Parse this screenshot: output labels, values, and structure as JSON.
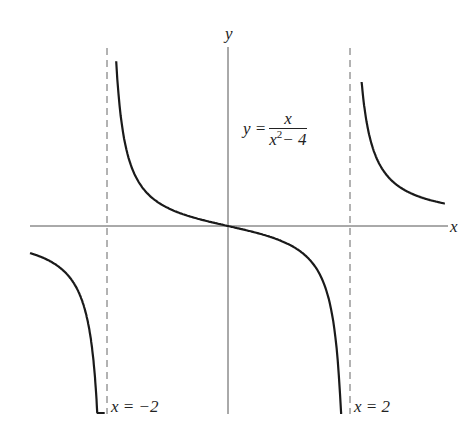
{
  "chart_data": {
    "type": "line",
    "title": "",
    "function": "y = x / (x^2 - 4)",
    "xlabel": "x",
    "ylabel": "y",
    "asymptotes": [
      {
        "type": "vertical",
        "x": -2,
        "label": "x = −2",
        "style": "dashed"
      },
      {
        "type": "vertical",
        "x": 2,
        "label": "x = 2",
        "style": "dashed"
      },
      {
        "type": "horizontal",
        "y": 0,
        "label": "",
        "style": "x-axis"
      }
    ],
    "xlim": [
      -3.26,
      3.6
    ],
    "grid": false,
    "series": [
      {
        "name": "left branch",
        "x_range": [
          -3.26,
          -2.03
        ]
      },
      {
        "name": "middle branch",
        "x_range": [
          -1.84,
          1.88
        ],
        "passes_through": [
          0,
          0
        ]
      },
      {
        "name": "right branch",
        "x_range": [
          2.2,
          3.57
        ]
      }
    ],
    "annotation": {
      "lhs": "y =",
      "numerator": "x",
      "denominator_base": "x",
      "denominator_exp": "2",
      "denominator_rest": "− 4"
    }
  },
  "labels": {
    "x_axis": "x",
    "y_axis": "y",
    "asym_left": "x = −2",
    "asym_right": "x = 2"
  },
  "geometry": {
    "origin_px": [
      228,
      226
    ],
    "px_per_unit_x": 60.75,
    "px_per_unit_y": 55,
    "color": "#1a1a1a"
  }
}
